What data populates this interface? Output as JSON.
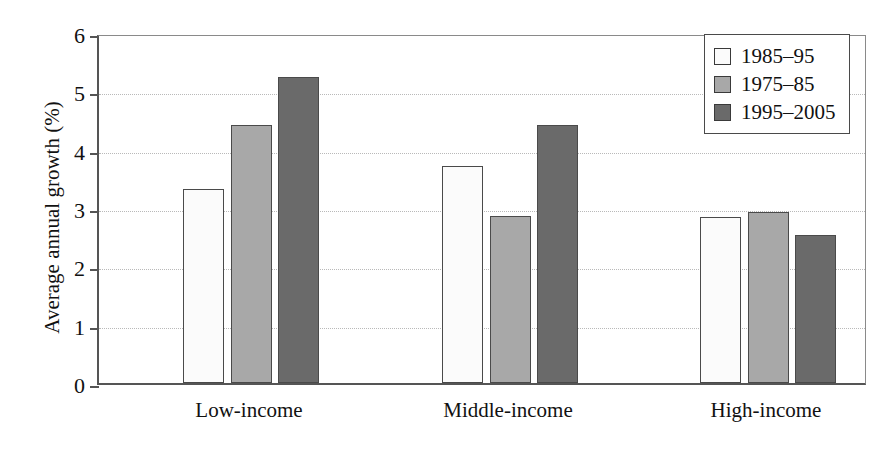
{
  "chart_data": {
    "type": "bar",
    "title": "",
    "xlabel": "",
    "ylabel": "Average annual growth (%)",
    "categories": [
      "Low-income",
      "Middle-income",
      "High-income"
    ],
    "series": [
      {
        "name": "1985–95",
        "color": "#fbfbfb",
        "values": [
          3.32,
          3.72,
          2.84
        ]
      },
      {
        "name": "1975–85",
        "color": "#a8a8a8",
        "values": [
          4.43,
          2.86,
          2.94
        ]
      },
      {
        "name": "1995–2005",
        "color": "#6a6a6a",
        "values": [
          5.24,
          4.43,
          2.53
        ]
      }
    ],
    "ylim": [
      0,
      6
    ],
    "yticks": [
      "0",
      "1",
      "2",
      "3",
      "4",
      "5",
      "6"
    ],
    "grid": true,
    "legend_position": "top-right"
  },
  "legend": {
    "items": [
      {
        "label": "1985–95"
      },
      {
        "label": "1975–85"
      },
      {
        "label": "1995–2005"
      }
    ]
  }
}
